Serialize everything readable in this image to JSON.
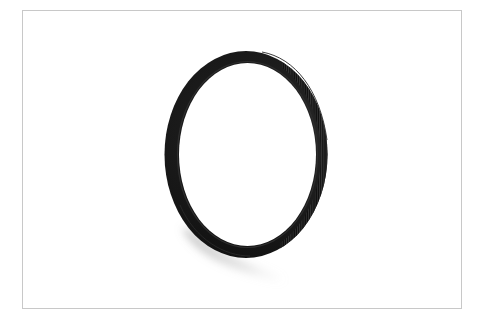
{
  "image": {
    "subject": "black camera lens filter ring",
    "background_color": "#ffffff",
    "frame": {
      "border_color": "#c8c8c8",
      "x": 22,
      "y": 10,
      "width": 440,
      "height": 299
    },
    "ring": {
      "color": "#0a0a0a",
      "highlight_color": "#2a2a2a",
      "knurl_color": "#3a3a3a",
      "center_x": 246,
      "center_y": 154.5,
      "outer_rx": 81.5,
      "outer_ry": 103.5,
      "inner_rx": 68.5,
      "inner_ry": 91.5
    },
    "shadow": {
      "color": "#9a9a9a"
    }
  }
}
